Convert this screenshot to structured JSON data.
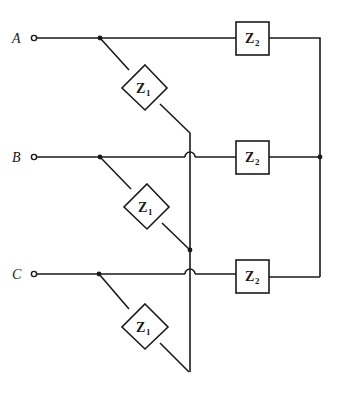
{
  "diagram": {
    "type": "three-phase impedance network",
    "colors": {
      "line": "#1a1a1a",
      "background": "#ffffff"
    },
    "terminals": [
      {
        "label": "A"
      },
      {
        "label": "B"
      },
      {
        "label": "C"
      }
    ],
    "impedances": {
      "z1": {
        "symbol": "Z",
        "subscript": "1",
        "shape": "diamond",
        "count": 3
      },
      "z2": {
        "symbol": "Z",
        "subscript": "2",
        "shape": "rectangle",
        "count": 3
      }
    },
    "branches": [
      {
        "phase": "A",
        "z1": {
          "symbol": "Z",
          "subscript": "1"
        },
        "z2": {
          "symbol": "Z",
          "subscript": "2"
        }
      },
      {
        "phase": "B",
        "z1": {
          "symbol": "Z",
          "subscript": "1"
        },
        "z2": {
          "symbol": "Z",
          "subscript": "2"
        }
      },
      {
        "phase": "C",
        "z1": {
          "symbol": "Z",
          "subscript": "1"
        },
        "z2": {
          "symbol": "Z",
          "subscript": "2"
        }
      }
    ],
    "connections": {
      "z2": "wye — all Z2 right ends tied to common node on right bus",
      "z1": "delta-like — each Z1 runs from its phase line diagonally down to the vertical bus; crossings shown as hop-overs"
    }
  }
}
